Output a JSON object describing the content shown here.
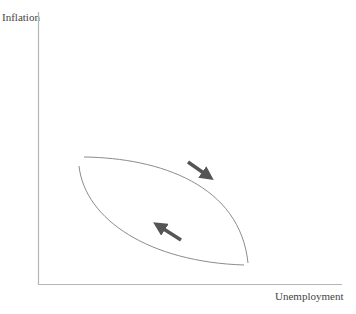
{
  "axes": {
    "y_label": "Inflation",
    "x_label": "Unemployment"
  },
  "diagram": {
    "title": "",
    "curves": [
      {
        "name": "upper-curve",
        "description": "concave arc from upper-left to lower-right"
      },
      {
        "name": "lower-curve",
        "description": "convex arc from upper-left to lower-right"
      }
    ],
    "arrows": [
      {
        "name": "arrow-down-right",
        "direction": "down-right"
      },
      {
        "name": "arrow-up-left",
        "direction": "up-left"
      }
    ],
    "colors": {
      "axis": "#b5b5b5",
      "curve": "#8c8c8c",
      "arrow": "#555555"
    }
  }
}
